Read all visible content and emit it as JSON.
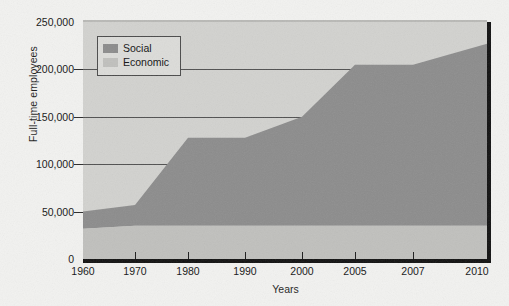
{
  "chart_data": {
    "type": "area",
    "title": "",
    "subtitle": "",
    "xlabel": "Years",
    "ylabel": "Full-time employees",
    "x": [
      "1960",
      "1970",
      "1980",
      "1990",
      "2000",
      "2005",
      "2007",
      "2010"
    ],
    "categories": [
      "1960",
      "1970",
      "1980",
      "1990",
      "2000",
      "2005",
      "2007",
      "2010"
    ],
    "series": [
      {
        "name": "Social",
        "color": "#8c8c8c",
        "stacked": true,
        "values": [
          18000,
          22000,
          93000,
          93000,
          115000,
          170000,
          170000,
          192000
        ]
      },
      {
        "name": "Economic",
        "color": "#c0c0bd",
        "stacked": true,
        "values": [
          32000,
          35000,
          35000,
          35000,
          35000,
          35000,
          35000,
          35000
        ]
      }
    ],
    "cumulative_totals": [
      50000,
      57000,
      128000,
      128000,
      150000,
      205000,
      205000,
      227000
    ],
    "yticks": [
      "0",
      "50,000",
      "100,000",
      "150,000",
      "200,000",
      "250,000"
    ],
    "ytick_values": [
      0,
      50000,
      100000,
      150000,
      200000,
      250000
    ],
    "ylim": [
      0,
      250000
    ],
    "xlim_labels": [
      "1960",
      "2010"
    ],
    "grid": true,
    "grid_axis": "y",
    "legend_position": "top-left",
    "plot_background": "#d2d2cf",
    "page_background": "#f2f2f0",
    "stack_order_bottom_to_top": [
      "Economic",
      "Social"
    ]
  },
  "legend": {
    "items": [
      {
        "label": "Social",
        "color": "#8c8c8c"
      },
      {
        "label": "Economic",
        "color": "#c0c0bd"
      }
    ]
  },
  "axes": {
    "y_title": "Full-time employees",
    "x_title": "Years",
    "y_ticks": [
      "250,000",
      "200,000",
      "150,000",
      "100,000",
      "50,000",
      "0"
    ],
    "x_ticks": [
      "1960",
      "1970",
      "1980",
      "1990",
      "2000",
      "2005",
      "2007",
      "2010"
    ]
  }
}
